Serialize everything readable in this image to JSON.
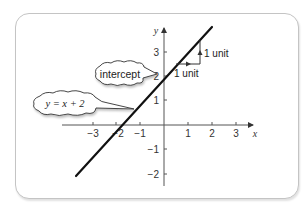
{
  "figure": {
    "axes": {
      "x_label": "x",
      "y_label": "y",
      "x_ticks": [
        "−3",
        "−2",
        "−1",
        "1",
        "2",
        "3"
      ],
      "y_ticks": [
        "3",
        "2",
        "1",
        "−1",
        "−2"
      ]
    },
    "line": {
      "equation_label": "y = x + 2",
      "slope": 1,
      "intercept": 2,
      "color": "#111111"
    },
    "callouts": {
      "intercept": "intercept",
      "equation": "y = x + 2"
    },
    "slope_triangle": {
      "run_label": "1 unit",
      "rise_label": "1 unit"
    },
    "colors": {
      "frame_border": "#c4c4c4",
      "axis": "#555555",
      "line": "#111111",
      "text": "#333333"
    }
  }
}
